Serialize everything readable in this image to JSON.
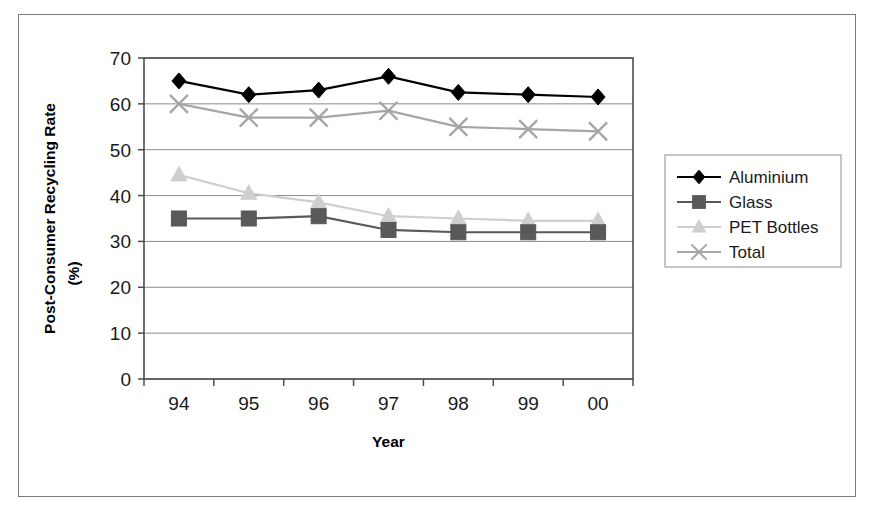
{
  "chart_data": {
    "type": "line",
    "title": "",
    "xlabel": "Year",
    "ylabel": "Post-Consumer Recycling Rate (%)",
    "ylabel_line1": "Post-Consumer Recycling Rate",
    "ylabel_line2": "(%)",
    "categories": [
      "94",
      "95",
      "96",
      "97",
      "98",
      "99",
      "00"
    ],
    "ylim": [
      0,
      70
    ],
    "yticks": [
      0,
      10,
      20,
      30,
      40,
      50,
      60,
      70
    ],
    "ytick_labels": [
      "0",
      "10",
      "20",
      "30",
      "40",
      "50",
      "60",
      "70"
    ],
    "grid": true,
    "grid_axis": "y",
    "legend_position": "right",
    "series": [
      {
        "name": "Aluminium",
        "marker": "diamond",
        "color": "#000000",
        "values": [
          65,
          62,
          63,
          66,
          62.5,
          62,
          61.5
        ]
      },
      {
        "name": "Glass",
        "marker": "square",
        "color": "#595959",
        "values": [
          35,
          35,
          35.5,
          32.5,
          32,
          32,
          32
        ]
      },
      {
        "name": "PET Bottles",
        "marker": "triangle",
        "color": "#cfcfcf",
        "values": [
          44.5,
          40.5,
          38.5,
          35.5,
          35,
          34.5,
          34.5
        ]
      },
      {
        "name": "Total",
        "marker": "x",
        "color": "#a6a6a6",
        "values": [
          60,
          57,
          57,
          58.5,
          55,
          54.5,
          54
        ]
      }
    ]
  },
  "colors": {
    "frame_border": "#7a7a7a",
    "plot_border": "#4d4d4d",
    "gridline": "#8c8c8c",
    "background": "#ffffff",
    "text": "#1a1a1a"
  }
}
